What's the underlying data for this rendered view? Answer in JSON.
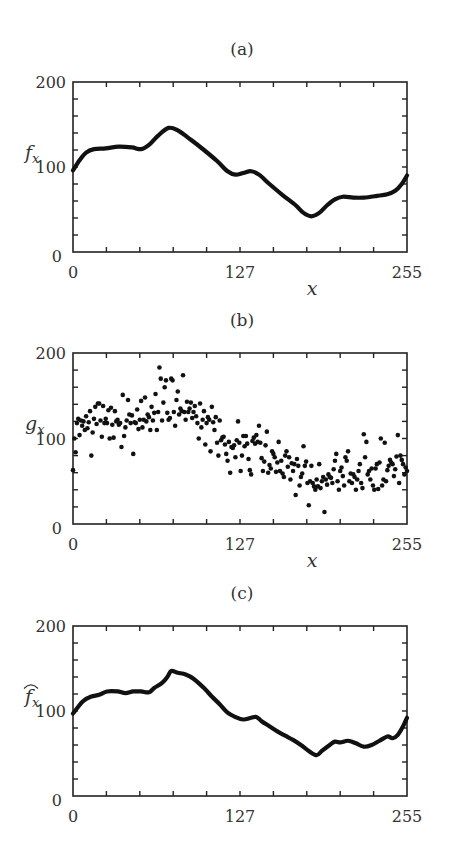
{
  "figure": {
    "panels": [
      {
        "id": "a",
        "title": "(a)",
        "ylabel": "f",
        "ylabel_sub": "x",
        "ylabel_hat": false,
        "xlabel": "x",
        "show_xlabel": true,
        "top": 82,
        "bottom": 252
      },
      {
        "id": "b",
        "title": "(b)",
        "ylabel": "g",
        "ylabel_sub": "x",
        "ylabel_hat": false,
        "xlabel": "x",
        "show_xlabel": true,
        "top": 353,
        "bottom": 524
      },
      {
        "id": "c",
        "title": "(c)",
        "ylabel": "f",
        "ylabel_sub": "x",
        "ylabel_hat": true,
        "xlabel": "",
        "show_xlabel": false,
        "top": 626,
        "bottom": 796
      }
    ],
    "frame": {
      "left": 73,
      "right": 407
    },
    "colors": {
      "line": "#111111",
      "axis": "#222222",
      "text": "#333333"
    }
  },
  "chart_data": [
    {
      "type": "line",
      "title": "(a)",
      "xlabel": "x",
      "ylabel": "f_x",
      "xlim": [
        0,
        255
      ],
      "ylim": [
        0,
        200
      ],
      "xticks": [
        0,
        127,
        255
      ],
      "yticks": [
        0,
        100,
        200
      ],
      "minor_xtick_step": 25.5,
      "minor_ytick_step": 20,
      "grid": false,
      "series": [
        {
          "name": "f_x",
          "x": [
            0,
            5,
            10,
            16,
            25,
            35,
            45,
            52,
            58,
            65,
            73,
            80,
            90,
            100,
            110,
            118,
            124,
            130,
            136,
            142,
            150,
            160,
            170,
            176,
            182,
            188,
            194,
            200,
            206,
            214,
            222,
            232,
            240,
            246,
            251,
            255
          ],
          "values": [
            96,
            108,
            117,
            121,
            122,
            124,
            123,
            121,
            126,
            137,
            146,
            143,
            132,
            120,
            107,
            95,
            91,
            93,
            95,
            91,
            80,
            67,
            55,
            46,
            42,
            46,
            55,
            62,
            65,
            64,
            64,
            66,
            68,
            72,
            80,
            90
          ]
        }
      ]
    },
    {
      "type": "scatter",
      "title": "(b)",
      "xlabel": "x",
      "ylabel": "g_x",
      "xlim": [
        0,
        255
      ],
      "ylim": [
        0,
        200
      ],
      "xticks": [
        0,
        127,
        255
      ],
      "yticks": [
        0,
        100,
        200
      ],
      "minor_xtick_step": 25.5,
      "minor_ytick_step": 20,
      "grid": false,
      "series": [
        {
          "name": "g_x",
          "x": [
            0,
            1,
            2,
            3,
            4,
            5,
            6,
            7,
            8,
            9,
            10,
            11,
            12,
            13,
            14,
            15,
            16,
            17,
            18,
            19,
            20,
            21,
            22,
            23,
            24,
            25,
            26,
            27,
            28,
            29,
            30,
            31,
            32,
            33,
            34,
            35,
            36,
            37,
            38,
            39,
            40,
            41,
            42,
            43,
            44,
            45,
            46,
            47,
            48,
            49,
            50,
            51,
            52,
            53,
            54,
            55,
            56,
            57,
            58,
            59,
            60,
            61,
            62,
            63,
            64,
            65,
            66,
            67,
            68,
            69,
            70,
            71,
            72,
            73,
            74,
            75,
            76,
            77,
            78,
            79,
            80,
            81,
            82,
            83,
            84,
            85,
            86,
            87,
            88,
            89,
            90,
            91,
            92,
            93,
            94,
            95,
            96,
            97,
            98,
            99,
            100,
            101,
            102,
            103,
            104,
            105,
            106,
            107,
            108,
            109,
            110,
            111,
            112,
            113,
            114,
            115,
            116,
            117,
            118,
            119,
            120,
            121,
            122,
            123,
            124,
            125,
            126,
            127,
            128,
            129,
            130,
            131,
            132,
            133,
            134,
            135,
            136,
            137,
            138,
            139,
            140,
            141,
            142,
            143,
            144,
            145,
            146,
            147,
            148,
            149,
            150,
            151,
            152,
            153,
            154,
            155,
            156,
            157,
            158,
            159,
            160,
            161,
            162,
            163,
            164,
            165,
            166,
            167,
            168,
            169,
            170,
            171,
            172,
            173,
            174,
            175,
            176,
            177,
            178,
            179,
            180,
            181,
            182,
            183,
            184,
            185,
            186,
            187,
            188,
            189,
            190,
            191,
            192,
            193,
            194,
            195,
            196,
            197,
            198,
            199,
            200,
            201,
            202,
            203,
            204,
            205,
            206,
            207,
            208,
            209,
            210,
            211,
            212,
            213,
            214,
            215,
            216,
            217,
            218,
            219,
            220,
            221,
            222,
            223,
            224,
            225,
            226,
            227,
            228,
            229,
            230,
            231,
            232,
            233,
            234,
            235,
            236,
            237,
            238,
            239,
            240,
            241,
            242,
            243,
            244,
            245,
            246,
            247,
            248,
            249,
            250,
            251,
            252,
            253,
            254,
            255
          ],
          "values": [
            63,
            100,
            84,
            118,
            123,
            104,
            121,
            115,
            120,
            110,
            126,
            112,
            119,
            132,
            80,
            107,
            123,
            137,
            117,
            141,
            141,
            121,
            102,
            138,
            118,
            123,
            118,
            133,
            100,
            136,
            116,
            101,
            132,
            120,
            122,
            116,
            118,
            90,
            151,
            103,
            113,
            121,
            145,
            128,
            118,
            127,
            82,
            119,
            118,
            134,
            111,
            122,
            144,
            113,
            122,
            148,
            120,
            128,
            125,
            110,
            137,
            121,
            130,
            152,
            110,
            131,
            183,
            170,
            121,
            142,
            160,
            168,
            130,
            122,
            124,
            170,
            168,
            131,
            115,
            145,
            155,
            128,
            135,
            132,
            174,
            131,
            122,
            143,
            131,
            135,
            142,
            124,
            131,
            138,
            126,
            118,
            100,
            141,
            113,
            122,
            132,
            93,
            118,
            125,
            122,
            85,
            137,
            119,
            110,
            125,
            95,
            80,
            121,
            98,
            101,
            102,
            93,
            82,
            74,
            96,
            60,
            90,
            89,
            92,
            78,
            98,
            120,
            95,
            62,
            80,
            103,
            91,
            103,
            94,
            76,
            63,
            58,
            97,
            101,
            94,
            104,
            96,
            115,
            95,
            77,
            62,
            73,
            92,
            108,
            60,
            69,
            65,
            85,
            82,
            78,
            61,
            72,
            96,
            62,
            74,
            59,
            55,
            80,
            85,
            67,
            78,
            52,
            71,
            62,
            70,
            34,
            76,
            68,
            45,
            55,
            59,
            91,
            68,
            73,
            48,
            22,
            50,
            68,
            48,
            44,
            40,
            52,
            44,
            70,
            42,
            50,
            55,
            14,
            52,
            46,
            58,
            55,
            54,
            48,
            64,
            74,
            82,
            50,
            40,
            62,
            66,
            56,
            45,
            78,
            74,
            85,
            50,
            59,
            48,
            58,
            55,
            40,
            52,
            62,
            70,
            48,
            42,
            105,
            78,
            96,
            58,
            62,
            52,
            65,
            45,
            40,
            65,
            70,
            41,
            72,
            100,
            45,
            52,
            95,
            50,
            63,
            68,
            75,
            72,
            70,
            56,
            64,
            79,
            104,
            48,
            80,
            75,
            70,
            58,
            66,
            62,
            90,
            84,
            78,
            64,
            88,
            76,
            103,
            96
          ]
        }
      ]
    },
    {
      "type": "line",
      "title": "(c)",
      "xlabel": "",
      "ylabel": "̂f_x",
      "xlim": [
        0,
        255
      ],
      "ylim": [
        0,
        200
      ],
      "xticks": [
        0,
        127,
        255
      ],
      "yticks": [
        0,
        100,
        200
      ],
      "minor_xtick_step": 25.5,
      "minor_ytick_step": 20,
      "grid": false,
      "series": [
        {
          "name": "f_hat_x",
          "x": [
            0,
            4,
            8,
            14,
            20,
            26,
            34,
            40,
            46,
            52,
            58,
            62,
            68,
            72,
            75,
            80,
            86,
            92,
            100,
            106,
            112,
            118,
            124,
            130,
            136,
            140,
            144,
            150,
            156,
            162,
            168,
            174,
            180,
            186,
            190,
            196,
            200,
            204,
            210,
            216,
            222,
            228,
            234,
            240,
            244,
            248,
            252,
            255
          ],
          "values": [
            97,
            105,
            112,
            117,
            119,
            123,
            123,
            121,
            123,
            123,
            122,
            127,
            133,
            140,
            147,
            145,
            143,
            138,
            127,
            117,
            108,
            98,
            93,
            90,
            92,
            93,
            88,
            82,
            76,
            71,
            66,
            60,
            53,
            48,
            53,
            60,
            64,
            63,
            65,
            62,
            58,
            60,
            65,
            70,
            68,
            72,
            82,
            92
          ]
        }
      ]
    }
  ]
}
